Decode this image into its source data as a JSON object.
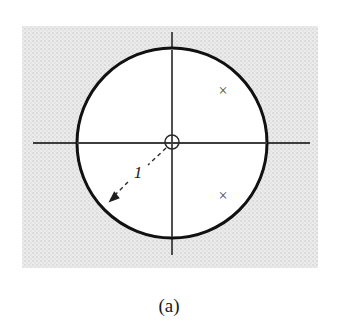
{
  "figure": {
    "caption": "(a)",
    "radius_label": "1",
    "unit_circle": {
      "cx": 172,
      "cy": 143,
      "r": 95
    },
    "zero_marker": {
      "cx": 172,
      "cy": 142,
      "r": 7
    },
    "poles": [
      {
        "symbol": "×",
        "x": 223,
        "y": 90
      },
      {
        "symbol": "×",
        "x": 223,
        "y": 195
      }
    ],
    "radius_label_pos": {
      "x": 138,
      "y": 172
    },
    "colors": {
      "panel_base": "#ebebeb",
      "panel_dot": "#d8d8d8",
      "circle_stroke": "#111111",
      "axis": "#3d3d3d",
      "marker": "#4a4a4a",
      "ink": "#1a1a1a"
    }
  }
}
